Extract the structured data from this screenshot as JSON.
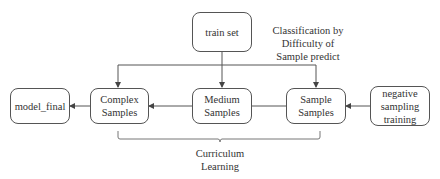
{
  "diagram": {
    "nodes": {
      "train_set": "train set",
      "model_final": "model_final",
      "complex": "Complex\nSamples",
      "medium": "Medium\nSamples",
      "simple": "Sample\nSamples",
      "negative": "negative\nsampling\ntraining"
    },
    "labels": {
      "classification": "Classification by\nDifficulty of\nSample predict",
      "curriculum": "Curriculum\nLearning"
    },
    "edges": [
      {
        "from": "train_set",
        "to": "complex"
      },
      {
        "from": "train_set",
        "to": "medium"
      },
      {
        "from": "train_set",
        "to": "simple"
      },
      {
        "from": "medium",
        "to": "complex"
      },
      {
        "from": "simple",
        "to": "medium"
      },
      {
        "from": "complex",
        "to": "model_final"
      },
      {
        "from": "negative",
        "to": "simple"
      }
    ],
    "colors": {
      "stroke": "#555555",
      "text": "#333333"
    }
  }
}
